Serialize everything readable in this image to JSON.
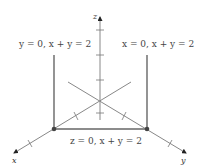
{
  "diagram": {
    "axes": {
      "x_label": "x",
      "y_label": "y",
      "z_label": "z"
    },
    "labels": {
      "left_edge": "y = 0, x + y = 2",
      "right_edge": "x = 0, x + y = 2",
      "bottom_edge": "z = 0, x + y = 2"
    },
    "colors": {
      "axis": "#888888",
      "edge": "#666666",
      "point": "#444444",
      "text": "#444444"
    }
  }
}
